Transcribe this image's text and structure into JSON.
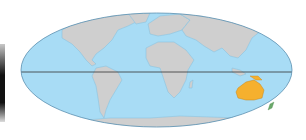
{
  "map": {
    "projection": "mollweide",
    "highlighted_region": "Australia",
    "colors": {
      "ocean": "#a8dcf5",
      "land": "#cfcfcf",
      "coast": "#7ab8d8",
      "highlight": "#f5b02e",
      "equator": "#333333",
      "border": "#5a8fb0"
    },
    "features": [
      "equator-line",
      "continents",
      "australia-highlight"
    ]
  }
}
